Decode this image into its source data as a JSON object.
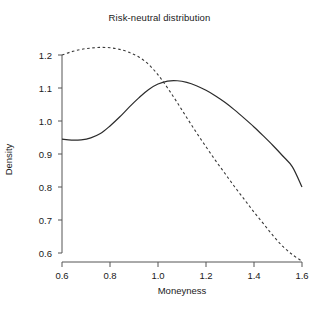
{
  "chart_data": {
    "type": "line",
    "title": "Risk-neutral distribution",
    "xlabel": "Moneyness",
    "ylabel": "Density",
    "xlim": [
      0.6,
      1.6
    ],
    "ylim": [
      0.6,
      1.2
    ],
    "xticks": [
      "0.6",
      "0.8",
      "1.0",
      "1.2",
      "1.4",
      "1.6"
    ],
    "xtick_values": [
      0.6,
      0.8,
      1.0,
      1.2,
      1.4,
      1.6
    ],
    "yticks": [
      "0.6",
      "0.7",
      "0.8",
      "0.9",
      "1.0",
      "1.1",
      "1.2"
    ],
    "ytick_values": [
      0.6,
      0.7,
      0.8,
      0.9,
      1.0,
      1.1,
      1.2
    ],
    "grid": false,
    "legend": "none",
    "series": [
      {
        "name": "solid-curve",
        "style": "solid",
        "color": "#2b2b2b",
        "x": [
          0.6,
          0.64,
          0.68,
          0.72,
          0.76,
          0.8,
          0.84,
          0.88,
          0.92,
          0.96,
          1.0,
          1.04,
          1.08,
          1.12,
          1.16,
          1.2,
          1.24,
          1.28,
          1.32,
          1.36,
          1.4,
          1.44,
          1.48,
          1.52,
          1.56,
          1.6
        ],
        "y": [
          0.945,
          0.942,
          0.943,
          0.949,
          0.962,
          0.985,
          1.012,
          1.042,
          1.07,
          1.095,
          1.112,
          1.121,
          1.122,
          1.117,
          1.107,
          1.093,
          1.076,
          1.056,
          1.033,
          1.008,
          0.982,
          0.954,
          0.925,
          0.894,
          0.861,
          0.8
        ]
      },
      {
        "name": "dashed-curve",
        "style": "dashed",
        "color": "#3a3a3a",
        "x": [
          0.6,
          0.64,
          0.68,
          0.72,
          0.76,
          0.8,
          0.84,
          0.88,
          0.92,
          0.96,
          1.0,
          1.04,
          1.08,
          1.12,
          1.16,
          1.2,
          1.24,
          1.28,
          1.32,
          1.36,
          1.4,
          1.44,
          1.48,
          1.52,
          1.56,
          1.6
        ],
        "y": [
          1.2,
          1.21,
          1.217,
          1.221,
          1.223,
          1.222,
          1.217,
          1.208,
          1.194,
          1.172,
          1.14,
          1.1,
          1.056,
          1.01,
          0.965,
          0.922,
          0.88,
          0.84,
          0.8,
          0.762,
          0.724,
          0.688,
          0.652,
          0.62,
          0.595,
          0.575
        ]
      }
    ],
    "annotations": [
      {
        "text": "solid curve peaks near moneyness 1.07 at density 1.122"
      },
      {
        "text": "dashed curve peaks near moneyness 0.78 at density 1.223"
      },
      {
        "text": "curves cross near moneyness 1.02 at density 1.118"
      }
    ]
  },
  "axes": {
    "x_axis_name": "moneyness-axis",
    "y_axis_name": "density-axis"
  }
}
